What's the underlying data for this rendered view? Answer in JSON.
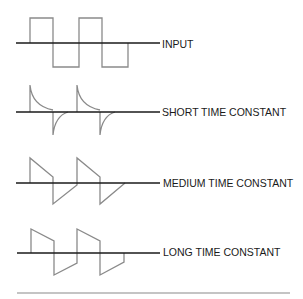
{
  "diagram": {
    "rows": [
      {
        "id": "input",
        "label": "INPUT",
        "axis_y": 43
      },
      {
        "id": "short",
        "label": "SHORT TIME CONSTANT",
        "axis_y": 112
      },
      {
        "id": "medium",
        "label": "MEDIUM TIME CONSTANT",
        "axis_y": 183
      },
      {
        "id": "long",
        "label": "LONG TIME CONSTANT",
        "axis_y": 253
      }
    ],
    "colors": {
      "axis": "#1a1a1a",
      "wave": "#8a8a8a",
      "rule": "#8a8a8a"
    }
  }
}
